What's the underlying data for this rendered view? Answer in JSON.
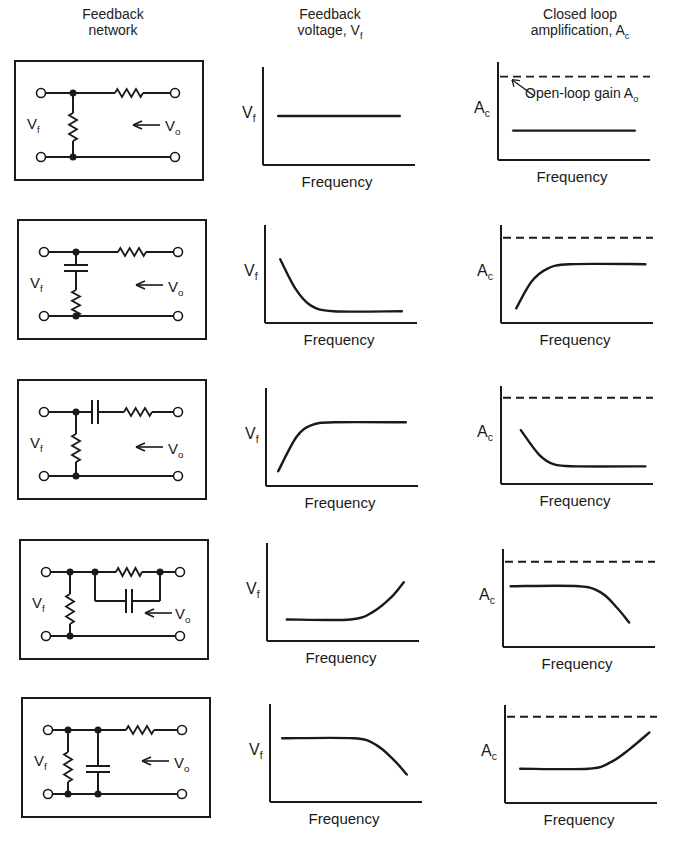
{
  "headers": {
    "network": {
      "line1": "Feedback",
      "line2": "network"
    },
    "voltage": {
      "line1": "Feedback",
      "line2": "voltage, V",
      "sub": "f"
    },
    "amplification": {
      "line1": "Closed loop",
      "line2": "amplification, A",
      "sub": "c"
    }
  },
  "labels": {
    "vf_main": "V",
    "vf_sub": "f",
    "vo_main": "V",
    "vo_sub": "o",
    "ac_main": "A",
    "ac_sub": "c",
    "xlabel": "Frequency",
    "open_loop_annotation": "Open-loop gain A",
    "open_loop_sub": "o"
  },
  "chart_data": [
    {
      "type": "line",
      "row": 1,
      "network": "resistive divider (series R, shunt R)",
      "vf": {
        "title": "Feedback voltage, Vf",
        "xlabel": "Frequency",
        "ylabel": "Vf",
        "shape": "flat",
        "x": [
          0.1,
          0.9
        ],
        "y": [
          0.5,
          0.5
        ]
      },
      "ac": {
        "title": "Closed loop amplification, Ac",
        "xlabel": "Frequency",
        "ylabel": "Ac",
        "shape": "flat",
        "open_loop_gain": 0.85,
        "x": [
          0.1,
          0.9
        ],
        "y": [
          0.3,
          0.3
        ],
        "annotation": "Open-loop gain Ao"
      }
    },
    {
      "type": "line",
      "row": 2,
      "network": "series R, shunt C in series with R",
      "vf": {
        "xlabel": "Frequency",
        "ylabel": "Vf",
        "shape": "decreasing then flat",
        "x": [
          0.1,
          0.2,
          0.3,
          0.45,
          0.9
        ],
        "y": [
          0.65,
          0.35,
          0.18,
          0.12,
          0.12
        ]
      },
      "ac": {
        "xlabel": "Frequency",
        "ylabel": "Ac",
        "shape": "rising then flat",
        "open_loop_gain": 0.87,
        "x": [
          0.1,
          0.2,
          0.3,
          0.45,
          0.95
        ],
        "y": [
          0.15,
          0.42,
          0.55,
          0.6,
          0.6
        ]
      }
    },
    {
      "type": "line",
      "row": 3,
      "network": "series C and R, shunt R",
      "vf": {
        "xlabel": "Frequency",
        "ylabel": "Vf",
        "shape": "rising then flat",
        "x": [
          0.08,
          0.2,
          0.3,
          0.45,
          0.92
        ],
        "y": [
          0.15,
          0.5,
          0.62,
          0.65,
          0.65
        ]
      },
      "ac": {
        "xlabel": "Frequency",
        "ylabel": "Ac",
        "shape": "decreasing then flat",
        "open_loop_gain": 0.88,
        "x": [
          0.13,
          0.25,
          0.35,
          0.5,
          0.95
        ],
        "y": [
          0.55,
          0.3,
          0.2,
          0.18,
          0.18
        ]
      }
    },
    {
      "type": "line",
      "row": 4,
      "network": "series R paralleled by C, shunt R",
      "vf": {
        "xlabel": "Frequency",
        "ylabel": "Vf",
        "shape": "flat then rising",
        "x": [
          0.13,
          0.55,
          0.7,
          0.82,
          0.9
        ],
        "y": [
          0.22,
          0.22,
          0.3,
          0.45,
          0.6
        ]
      },
      "ac": {
        "xlabel": "Frequency",
        "ylabel": "Ac",
        "shape": "flat then falling",
        "open_loop_gain": 0.87,
        "x": [
          0.05,
          0.5,
          0.65,
          0.75,
          0.83
        ],
        "y": [
          0.62,
          0.62,
          0.55,
          0.4,
          0.25
        ]
      }
    },
    {
      "type": "line",
      "row": 5,
      "network": "series R, shunt R paralleled by C",
      "vf": {
        "xlabel": "Frequency",
        "ylabel": "Vf",
        "shape": "flat then falling",
        "x": [
          0.08,
          0.55,
          0.7,
          0.82,
          0.9
        ],
        "y": [
          0.65,
          0.65,
          0.58,
          0.42,
          0.28
        ]
      },
      "ac": {
        "xlabel": "Frequency",
        "ylabel": "Ac",
        "shape": "flat then rising",
        "open_loop_gain": 0.88,
        "x": [
          0.1,
          0.55,
          0.7,
          0.82,
          0.95
        ],
        "y": [
          0.35,
          0.35,
          0.42,
          0.55,
          0.72
        ]
      }
    }
  ]
}
